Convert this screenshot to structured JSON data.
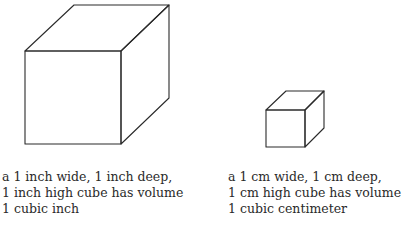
{
  "colors": {
    "line": "#2a2a2a",
    "background": "#ffffff"
  },
  "inch_cube": {
    "caption": [
      "a 1 inch wide, 1 inch deep,",
      "1 inch high cube has volume",
      "1 cubic inch"
    ]
  },
  "cm_cube": {
    "caption": [
      "a 1 cm wide, 1 cm deep,",
      "1 cm high cube has volume",
      "1 cubic centimeter"
    ]
  }
}
